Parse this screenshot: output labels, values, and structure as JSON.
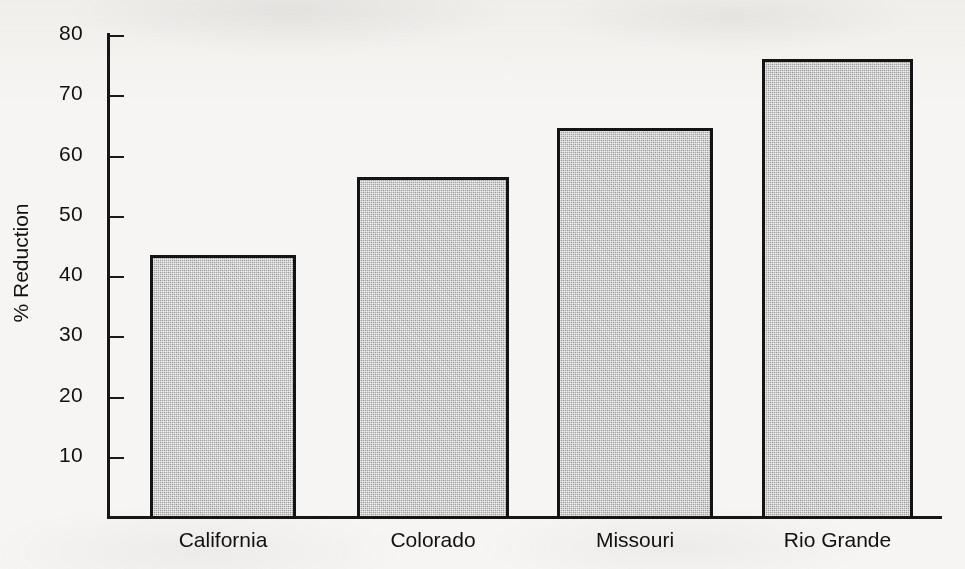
{
  "chart_data": {
    "type": "bar",
    "title": "",
    "subtitle": "",
    "xlabel": "",
    "ylabel": "% Reduction",
    "categories": [
      "California",
      "Colorado",
      "Missouri",
      "Rio Grande"
    ],
    "values": [
      43.5,
      56.5,
      64.5,
      76
    ],
    "series": [
      {
        "name": "% Reduction",
        "values": [
          43.5,
          56.5,
          64.5,
          76
        ]
      }
    ],
    "ylim": [
      0,
      80
    ],
    "ytick_labels": [
      "10",
      "20",
      "30",
      "40",
      "50",
      "60",
      "70",
      "80"
    ],
    "ytick_values": [
      10,
      20,
      30,
      40,
      50,
      60,
      70,
      80
    ],
    "grid": false,
    "legend": false,
    "legend_position": "none",
    "annotations": [],
    "colors": {
      "bar_fill": "#a9a9a9",
      "bar_border": "#141414",
      "axis": "#161616",
      "text": "#111111",
      "background": "#f6f5f3"
    }
  }
}
